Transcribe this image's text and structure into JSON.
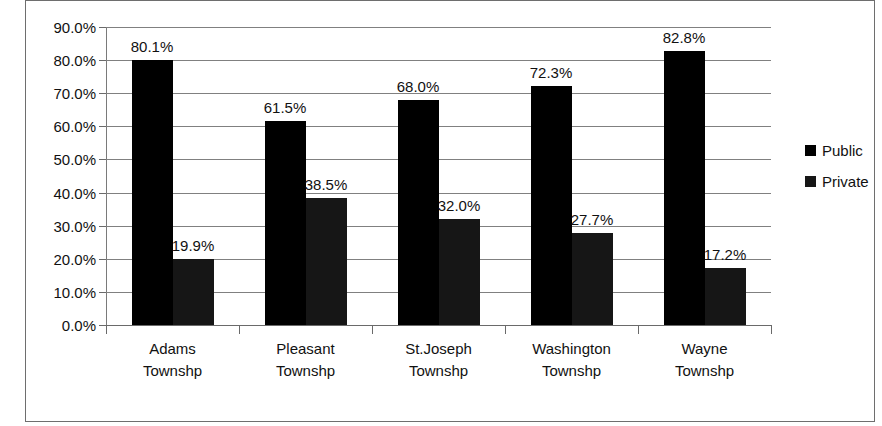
{
  "chart_data": {
    "type": "bar",
    "title": "",
    "subtitle": "",
    "xlabel": "",
    "ylabel": "",
    "categories": [
      "Adams Townshp",
      "Pleasant Townshp",
      "St.Joseph Townshp",
      "Washington Townshp",
      "Wayne Townshp"
    ],
    "category_lines": [
      [
        "Adams",
        "Townshp"
      ],
      [
        "Pleasant",
        "Townshp"
      ],
      [
        "St.Joseph",
        "Townshp"
      ],
      [
        "Washington",
        "Townshp"
      ],
      [
        "Wayne",
        "Townshp"
      ]
    ],
    "series": [
      {
        "name": "Public",
        "color": "#000000",
        "values": [
          80.1,
          61.5,
          68.0,
          72.3,
          82.8
        ],
        "labels": [
          "80.1%",
          "61.5%",
          "68.0%",
          "72.3%",
          "82.8%"
        ]
      },
      {
        "name": "Private",
        "color": "#161616",
        "values": [
          19.9,
          38.5,
          32.0,
          27.7,
          17.2
        ],
        "labels": [
          "19.9%",
          "38.5%",
          "32.0%",
          "27.7%",
          "17.2%"
        ]
      }
    ],
    "ylim": [
      0,
      90
    ],
    "ytick_values": [
      0,
      10,
      20,
      30,
      40,
      50,
      60,
      70,
      80,
      90
    ],
    "ytick_labels": [
      "0.0%",
      "10.0%",
      "20.0%",
      "30.0%",
      "40.0%",
      "50.0%",
      "60.0%",
      "70.0%",
      "80.0%",
      "90.0%"
    ],
    "grid": true,
    "grid_axis": "y",
    "legend": {
      "position": "right",
      "entries": [
        "Public",
        "Private"
      ]
    }
  }
}
